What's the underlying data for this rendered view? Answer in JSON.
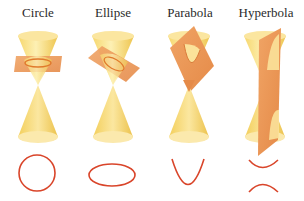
{
  "colors": {
    "cone_light": "#fbe9a0",
    "cone_mid": "#f4d36a",
    "cone_dark": "#e9bf45",
    "plane": "#ec9656",
    "plane_edge": "#d97b3a",
    "curve": "#d9452a",
    "label": "#2a2a2a"
  },
  "sections": [
    {
      "id": "circle",
      "label": "Circle",
      "curve_shape": "circle",
      "plane": "horizontal"
    },
    {
      "id": "ellipse",
      "label": "Ellipse",
      "curve_shape": "ellipse",
      "plane": "tilted"
    },
    {
      "id": "parabola",
      "label": "Parabola",
      "curve_shape": "parabola",
      "plane": "parallel to cone side"
    },
    {
      "id": "hyperbola",
      "label": "Hyperbola",
      "curve_shape": "hyperbola (two branches)",
      "plane": "vertical"
    }
  ]
}
